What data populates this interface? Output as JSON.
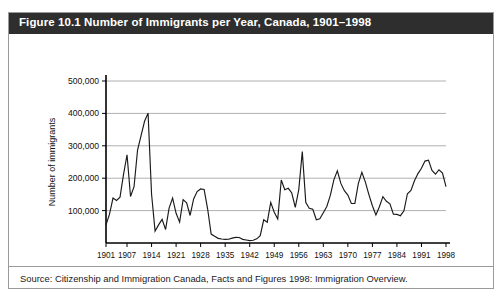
{
  "figure": {
    "title": "Figure 10.1 Number of Immigrants per Year, Canada, 1901–1998",
    "source": "Source: Citizenship and Immigration Canada, Facts and Figures 1998: Immigration Overview.",
    "title_band_color": "#2e2e2e",
    "title_text_color": "#ffffff",
    "border_color": "#9a9a9a",
    "line_color": "#1a1a1a",
    "grid_color": "#b0b0b0"
  },
  "chart_data": {
    "type": "line",
    "title": "Figure 10.1 Number of Immigrants per Year, Canada, 1901–1998",
    "xlabel": "",
    "ylabel": "Number of immigrants",
    "xlim": [
      1901,
      1998
    ],
    "ylim": [
      0,
      500000
    ],
    "grid": true,
    "legend": "none",
    "ytick_labels": [
      "100,000",
      "200,000",
      "300,000",
      "400,000",
      "500,000"
    ],
    "ytick_values": [
      100000,
      200000,
      300000,
      400000,
      500000
    ],
    "xtick_labels": [
      "1901",
      "1907",
      "1914",
      "1921",
      "1928",
      "1935",
      "1942",
      "1949",
      "1956",
      "1963",
      "1970",
      "1977",
      "1984",
      "1991",
      "1998"
    ],
    "xtick_values": [
      1901,
      1907,
      1914,
      1921,
      1928,
      1935,
      1942,
      1949,
      1956,
      1963,
      1970,
      1977,
      1984,
      1991,
      1998
    ],
    "x": [
      1901,
      1902,
      1903,
      1904,
      1905,
      1906,
      1907,
      1908,
      1909,
      1910,
      1911,
      1912,
      1913,
      1914,
      1915,
      1916,
      1917,
      1918,
      1919,
      1920,
      1921,
      1922,
      1923,
      1924,
      1925,
      1926,
      1927,
      1928,
      1929,
      1930,
      1931,
      1932,
      1933,
      1934,
      1935,
      1936,
      1937,
      1938,
      1939,
      1940,
      1941,
      1942,
      1943,
      1944,
      1945,
      1946,
      1947,
      1948,
      1949,
      1950,
      1951,
      1952,
      1953,
      1954,
      1955,
      1956,
      1957,
      1958,
      1959,
      1960,
      1961,
      1962,
      1963,
      1964,
      1965,
      1966,
      1967,
      1968,
      1969,
      1970,
      1971,
      1972,
      1973,
      1974,
      1975,
      1976,
      1977,
      1978,
      1979,
      1980,
      1981,
      1982,
      1983,
      1984,
      1985,
      1986,
      1987,
      1988,
      1989,
      1990,
      1991,
      1992,
      1993,
      1994,
      1995,
      1996,
      1997,
      1998
    ],
    "values": [
      55747,
      89102,
      138660,
      131252,
      141465,
      211653,
      272409,
      143326,
      173694,
      286839,
      331288,
      375756,
      400870,
      150484,
      36665,
      55914,
      72910,
      41845,
      107698,
      138824,
      91728,
      64224,
      133729,
      124164,
      84907,
      135982,
      158886,
      166783,
      164993,
      104806,
      27530,
      20591,
      14382,
      12476,
      11277,
      11643,
      15101,
      17244,
      16994,
      11324,
      9329,
      7576,
      8504,
      12801,
      22722,
      71719,
      64127,
      125414,
      95217,
      73912,
      194391,
      164498,
      168868,
      154227,
      109946,
      164857,
      282164,
      124851,
      106928,
      104111,
      71689,
      74586,
      93151,
      112606,
      146758,
      194743,
      222876,
      183974,
      161531,
      147713,
      121900,
      122006,
      184200,
      218465,
      187881,
      149429,
      114914,
      86313,
      112096,
      143117,
      128618,
      121147,
      89157,
      88239,
      84302,
      99219,
      152098,
      161929,
      192001,
      214230,
      230781,
      252842,
      255819,
      223875,
      212270,
      226039,
      216014,
      174100
    ],
    "annotations": [
      {
        "label": "peak",
        "x": 1913,
        "y": 400870
      },
      {
        "label": "post-war spike",
        "x": 1957,
        "y": 282164
      },
      {
        "label": "depression trough",
        "x": 1935,
        "y": 11277
      }
    ]
  }
}
